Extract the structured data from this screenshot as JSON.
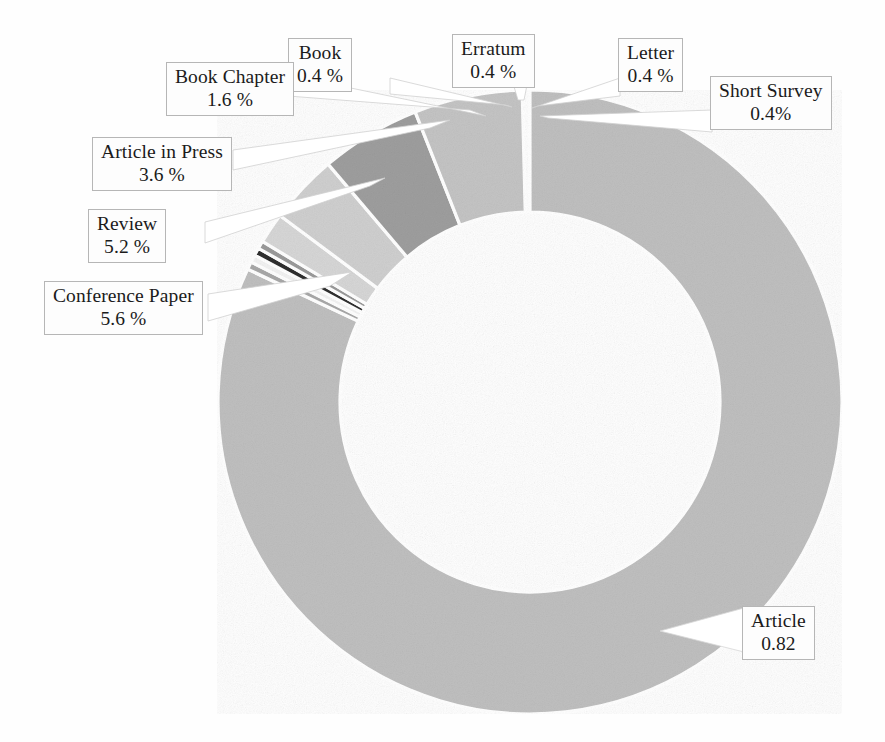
{
  "figure": {
    "kind": "donut-chart",
    "background_color": "#fefefe",
    "text_color": "#1b1b1b",
    "label_box_border_color": "#b6b6b6",
    "label_box_fill_color": "#fdfdfd",
    "leader_line_color": "#c9c9c9",
    "slice_separator_color": "#ffffff"
  },
  "chart_data": {
    "type": "pie",
    "variant": "donut",
    "title": "",
    "subtitle": "",
    "xlabel": "",
    "ylabel": "",
    "grid": false,
    "legend_position": "none",
    "label_format": "percent",
    "start_angle_deg": 0,
    "direction": "clockwise",
    "inner_radius_ratio": 0.61,
    "center_px": [
      530,
      402
    ],
    "outer_radius_px": 312,
    "inner_radius_px": 190,
    "categories": [
      "Article",
      "Short Survey",
      "Letter",
      "Erratum",
      "Book",
      "Book Chapter",
      "Article in Press",
      "Review",
      "Conference Paper"
    ],
    "values": [
      82.0,
      0.4,
      0.4,
      0.4,
      0.4,
      1.6,
      3.6,
      5.2,
      5.6
    ],
    "value_labels": [
      "0.82",
      "0.4%",
      "0.4 %",
      "0.4 %",
      "0.4 %",
      "1.6 %",
      "3.6 %",
      "5.2 %",
      "5.6 %"
    ],
    "colors": [
      "#bfbfbf",
      "#a8a8a8",
      "#f2f2f2",
      "#2e2e2e",
      "#9a9a9a",
      "#d6d6d6",
      "#cfcfcf",
      "#9e9e9e",
      "#c4c4c4"
    ]
  },
  "slices": [
    {
      "name": "article",
      "label": "Article",
      "value_label": "0.82",
      "percent": 82.0,
      "color": "#bfbfbf",
      "start_deg": 0,
      "sweep_deg": 295.2
    },
    {
      "name": "short-survey",
      "label": "Short Survey",
      "value_label": "0.4%",
      "percent": 0.4,
      "color": "#a8a8a8",
      "start_deg": 295.2,
      "sweep_deg": 1.44
    },
    {
      "name": "letter",
      "label": "Letter",
      "value_label": "0.4 %",
      "percent": 0.4,
      "color": "#f2f2f2",
      "start_deg": 296.64,
      "sweep_deg": 1.44
    },
    {
      "name": "erratum",
      "label": "Erratum",
      "value_label": "0.4 %",
      "percent": 0.4,
      "color": "#2e2e2e",
      "start_deg": 298.08,
      "sweep_deg": 1.44
    },
    {
      "name": "book",
      "label": "Book",
      "value_label": "0.4 %",
      "percent": 0.4,
      "color": "#9a9a9a",
      "start_deg": 299.52,
      "sweep_deg": 1.44
    },
    {
      "name": "book-chapter",
      "label": "Book Chapter",
      "value_label": "1.6 %",
      "percent": 1.6,
      "color": "#d6d6d6",
      "start_deg": 300.96,
      "sweep_deg": 5.76
    },
    {
      "name": "article-in-press",
      "label": "Article in Press",
      "value_label": "3.6 %",
      "percent": 3.6,
      "color": "#cfcfcf",
      "start_deg": 306.72,
      "sweep_deg": 12.96
    },
    {
      "name": "review",
      "label": "Review",
      "value_label": "5.2 %",
      "percent": 5.2,
      "color": "#9e9e9e",
      "start_deg": 319.68,
      "sweep_deg": 18.72
    },
    {
      "name": "conference-paper",
      "label": "Conference Paper",
      "value_label": "5.6 %",
      "percent": 5.6,
      "color": "#c4c4c4",
      "start_deg": 338.4,
      "sweep_deg": 20.16
    }
  ],
  "callouts": {
    "book_chapter": {
      "label": "Book Chapter",
      "value": "1.6 %"
    },
    "book": {
      "label": "Book",
      "value": "0.4 %"
    },
    "erratum": {
      "label": "Erratum",
      "value": "0.4 %"
    },
    "letter": {
      "label": "Letter",
      "value": "0.4 %"
    },
    "short_survey": {
      "label": "Short Survey",
      "value": "0.4%"
    },
    "article_in_press": {
      "label": "Article in Press",
      "value": "3.6 %"
    },
    "review": {
      "label": "Review",
      "value": "5.2 %"
    },
    "conference_paper": {
      "label": "Conference Paper",
      "value": "5.6 %"
    },
    "article": {
      "label": "Article",
      "value": "0.82"
    }
  }
}
